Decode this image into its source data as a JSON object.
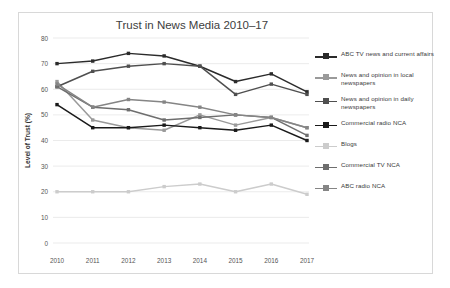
{
  "chart_data": {
    "type": "line",
    "title": "Trust in News Media 2010–17",
    "xlabel": "",
    "ylabel": "Level of Trust (%)",
    "categories": [
      "2010",
      "2011",
      "2012",
      "2013",
      "2014",
      "2015",
      "2016",
      "2017"
    ],
    "x_tick_labels": [
      "2010",
      "2011",
      "2012",
      "2013",
      "2014",
      "2015",
      "2016",
      "2017"
    ],
    "y_tick_labels": [
      "0",
      "10",
      "20",
      "30",
      "40",
      "50",
      "60",
      "70",
      "80"
    ],
    "ylim": [
      0,
      80
    ],
    "y_tick_step": 10,
    "grid": "horizontal",
    "legend_position": "right",
    "series": [
      {
        "name": "ABC TV news and current affairs",
        "values": [
          70,
          71,
          74,
          73,
          69,
          63,
          66,
          59
        ],
        "color": "#2b2b2b",
        "marker": "square"
      },
      {
        "name": "News and opinion in local newspapers",
        "values": [
          63,
          48,
          45,
          44,
          50,
          46,
          49,
          45
        ],
        "color": "#9a9a9a",
        "marker": "square"
      },
      {
        "name": "News and opinion in daily newspapers",
        "values": [
          61,
          67,
          69,
          70,
          69,
          58,
          62,
          58
        ],
        "color": "#4f4f4f",
        "marker": "square"
      },
      {
        "name": "Commercial radio NCA",
        "values": [
          54,
          45,
          45,
          46,
          45,
          44,
          46,
          40
        ],
        "color": "#1a1a1a",
        "marker": "square"
      },
      {
        "name": "Blogs",
        "values": [
          20,
          20,
          20,
          22,
          23,
          20,
          23,
          19
        ],
        "color": "#cccccc",
        "marker": "square"
      },
      {
        "name": "Commercial TV NCA",
        "values": [
          61,
          53,
          52,
          48,
          49,
          50,
          49,
          42
        ],
        "color": "#6e6e6e",
        "marker": "square"
      },
      {
        "name": "ABC radio NCA",
        "values": [
          62,
          53,
          56,
          55,
          53,
          50,
          49,
          45
        ],
        "color": "#858585",
        "marker": "square"
      }
    ]
  },
  "legend": {
    "items": [
      {
        "label": "ABC TV news and current affairs"
      },
      {
        "label": "News and opinion in local newspapers"
      },
      {
        "label": "News and opinion in daily newspapers"
      },
      {
        "label": "Commercial radio NCA"
      },
      {
        "label": "Blogs"
      },
      {
        "label": "Commercial TV NCA"
      },
      {
        "label": "ABC radio NCA"
      }
    ]
  }
}
